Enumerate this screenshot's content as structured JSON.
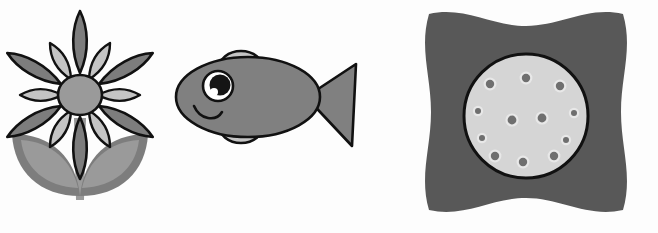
{
  "scene": {
    "title": "Grayscale clipart illustrations",
    "background_color": "#fdfdfd",
    "width": 658,
    "height": 233,
    "object_count": 3,
    "style": "flat grayscale clip-art with black outlines"
  },
  "palette": {
    "outline": "#111111",
    "dark_gray": "#585858",
    "mid_gray": "#808080",
    "petal_gray": "#7d7d7d",
    "light_gray": "#d5d5d5",
    "pale_gray": "#c4c4c4",
    "leaf_light": "#9a9a9a",
    "white": "#ffffff"
  },
  "objects": [
    {
      "id": "flower",
      "name": "Flower",
      "label": "flower-figure",
      "position": {
        "x": 0,
        "y": 0,
        "width": 220,
        "height": 233
      },
      "parts": [
        {
          "name": "outer-petals",
          "count": 6,
          "color": "#7d7d7d",
          "outline": "#111111"
        },
        {
          "name": "inner-petals",
          "count": 6,
          "color": "#c4c4c4",
          "outline": "#111111"
        },
        {
          "name": "center-disc",
          "shape": "circle",
          "color": "#9a9a9a",
          "outline": "#111111"
        },
        {
          "name": "stem",
          "color": "#9a9a9a"
        },
        {
          "name": "leaves",
          "count": 2,
          "edge_color": "#7d7d7d",
          "fill_color": "#9a9a9a"
        }
      ]
    },
    {
      "id": "fish",
      "name": "Fish",
      "label": "fish-figure",
      "position": {
        "x": 160,
        "y": 0,
        "width": 220,
        "height": 233
      },
      "facing": "left",
      "parts": [
        {
          "name": "body",
          "color": "#808080",
          "outline": "#111111"
        },
        {
          "name": "tail",
          "shape": "triangle",
          "color": "#808080",
          "outline": "#111111"
        },
        {
          "name": "dorsal-fin",
          "color": "#c4c4c4",
          "outline": "#111111"
        },
        {
          "name": "ventral-fin",
          "color": "#c4c4c4",
          "outline": "#111111"
        },
        {
          "name": "eye",
          "iris_color": "#151515",
          "highlight_color": "#ffffff",
          "outline": "#111111"
        },
        {
          "name": "mouth",
          "shape": "smile-arc",
          "color": "#111111"
        }
      ]
    },
    {
      "id": "lotus-pod",
      "name": "Lotus seed pod",
      "label": "lotus-pod-figure",
      "position": {
        "x": 395,
        "y": 0,
        "width": 263,
        "height": 233
      },
      "parts": [
        {
          "name": "outer-pad",
          "shape": "concave-square-blob",
          "color": "#585858"
        },
        {
          "name": "inner-disc",
          "shape": "circle",
          "color": "#d5d5d5",
          "outline": "#111111"
        },
        {
          "name": "seeds",
          "count": 12,
          "ring_color": "#e8e8e8",
          "core_color": "#6f6f6f"
        }
      ]
    }
  ],
  "seed_positions": [
    {
      "cx": 0,
      "cy": -38,
      "r": 4.2
    },
    {
      "cx": 34,
      "cy": -30,
      "r": 4.2
    },
    {
      "cx": 48,
      "cy": -3,
      "r": 3.0
    },
    {
      "cx": 40,
      "cy": 24,
      "r": 3.0
    },
    {
      "cx": 28,
      "cy": 40,
      "r": 4.2
    },
    {
      "cx": -3,
      "cy": 46,
      "r": 4.2
    },
    {
      "cx": -31,
      "cy": 40,
      "r": 4.2
    },
    {
      "cx": -44,
      "cy": 22,
      "r": 3.0
    },
    {
      "cx": -48,
      "cy": -5,
      "r": 3.0
    },
    {
      "cx": -36,
      "cy": -32,
      "r": 4.2
    },
    {
      "cx": -14,
      "cy": 4,
      "r": 4.4
    },
    {
      "cx": 16,
      "cy": 2,
      "r": 4.4
    }
  ]
}
